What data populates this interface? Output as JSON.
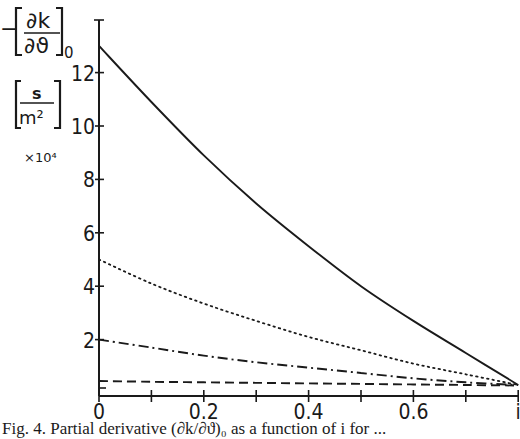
{
  "chart_data": {
    "type": "line",
    "title": "",
    "xlabel": "i",
    "ylabel": "-[∂k/∂ϑ]_0 [s/m²] ×10^4",
    "ylabel_parts": {
      "prefix": "−",
      "numerator": "∂k",
      "denominator": "∂ϑ",
      "subscript": "0",
      "unit_numerator": "s",
      "unit_denominator": "m²",
      "scale": "×10⁴"
    },
    "xlim": [
      0,
      1
    ],
    "ylim": [
      0,
      14
    ],
    "x_ticks": [
      0,
      0.1,
      0.2,
      0.3,
      0.4,
      0.5,
      0.6,
      0.7,
      0.8
    ],
    "x_tick_labels": [
      "0",
      "0.2",
      "0.4",
      "0.6",
      "i"
    ],
    "x_tick_label_values": [
      0,
      0.2,
      0.4,
      0.6,
      0.8
    ],
    "y_tick_labels": [
      "2",
      "4",
      "6",
      "8",
      "10",
      "12"
    ],
    "y_tick_values": [
      2,
      4,
      6,
      8,
      10,
      12
    ],
    "grid": false,
    "legend": null,
    "x": [
      0,
      0.1,
      0.2,
      0.3,
      0.4,
      0.5,
      0.6,
      0.7,
      0.8
    ],
    "series": [
      {
        "name": "solid",
        "style": "solid",
        "values": [
          13.0,
          10.9,
          8.9,
          7.1,
          5.5,
          4.0,
          2.7,
          1.5,
          0.3
        ]
      },
      {
        "name": "dotted",
        "style": "dotted",
        "values": [
          5.0,
          4.1,
          3.35,
          2.7,
          2.1,
          1.6,
          1.1,
          0.7,
          0.3
        ]
      },
      {
        "name": "dash-dot",
        "style": "dashdot",
        "values": [
          2.0,
          1.7,
          1.4,
          1.15,
          0.95,
          0.75,
          0.55,
          0.4,
          0.3
        ]
      },
      {
        "name": "dashed",
        "style": "dashed",
        "values": [
          0.45,
          0.42,
          0.4,
          0.38,
          0.36,
          0.34,
          0.32,
          0.3,
          0.28
        ]
      }
    ]
  },
  "caption": "Fig. 4. Partial derivative (∂k/∂ϑ)₀ as a function of i for ..."
}
